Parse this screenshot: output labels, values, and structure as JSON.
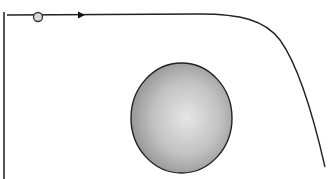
{
  "diagram": {
    "elements": {
      "left_boundary": {
        "type": "vertical-bar",
        "color": "#555555"
      },
      "trajectory": {
        "type": "curve",
        "color": "#222222",
        "shape": "horizontal then bending downward"
      },
      "start_marker": {
        "type": "circle",
        "fill": "#d8d8d8",
        "stroke": "#333333"
      },
      "direction_arrow": {
        "type": "arrowhead",
        "direction": "right",
        "color": "#111111"
      },
      "sphere": {
        "type": "shaded-sphere",
        "highlight": "#e6e6e6",
        "shadow": "#8c8c8c",
        "stroke": "#222222"
      }
    }
  }
}
